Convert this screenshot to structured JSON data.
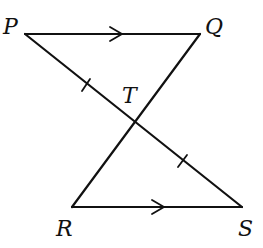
{
  "figure": {
    "colors": {
      "line": "#111111",
      "background": "#ffffff"
    },
    "points": {
      "P": {
        "label": "P",
        "x": 25,
        "y": 34
      },
      "Q": {
        "label": "Q",
        "x": 200,
        "y": 34
      },
      "R": {
        "label": "R",
        "x": 72,
        "y": 207
      },
      "S": {
        "label": "S",
        "x": 242,
        "y": 207
      },
      "T": {
        "label": "T",
        "x": 135,
        "y": 123
      }
    },
    "segments": [
      {
        "from": "P",
        "to": "Q",
        "marking": "parallel-arrow"
      },
      {
        "from": "R",
        "to": "S",
        "marking": "parallel-arrow"
      },
      {
        "from": "P",
        "to": "S",
        "marking": "none"
      },
      {
        "from": "Q",
        "to": "R",
        "marking": "none"
      },
      {
        "from": "P",
        "to": "T",
        "marking": "single-tick"
      },
      {
        "from": "T",
        "to": "S",
        "marking": "single-tick"
      }
    ],
    "relations": [
      "PQ ∥ RS",
      "PT = TS"
    ]
  }
}
